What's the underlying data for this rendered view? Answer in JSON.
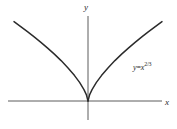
{
  "figure": {
    "background_color": "#ffffff",
    "ink_color": "#2b2b2b",
    "axis_color": "#4a4a4a",
    "width": 177,
    "height": 129
  },
  "axes": {
    "x_label": "x",
    "y_label": "y",
    "origin": {
      "x": 88,
      "y": 101
    },
    "x_axis_start_px": 8,
    "x_axis_end_px": 162,
    "y_axis_top_px": 16,
    "y_axis_bottom_px": 120
  },
  "annotation": {
    "equation_y": "y",
    "equation_equals": "=",
    "equation_base": "x",
    "equation_exponent": "2/3",
    "equation_full": "y=x^(2/3)"
  },
  "chart_data": {
    "type": "line",
    "title": "",
    "xlabel": "x",
    "ylabel": "y",
    "grid": false,
    "legend": "none",
    "annotations": [
      {
        "text": "y=x^(2/3)",
        "x_px": 133,
        "y_px": 61
      }
    ],
    "xlim": [
      -2.2,
      2.2
    ],
    "ylim": [
      0,
      1.75
    ],
    "series": [
      {
        "name": "y=x^(2/3)",
        "color": "#2b2b2b",
        "x": [
          -2.2,
          -2.0,
          -1.8,
          -1.6,
          -1.4,
          -1.2,
          -1.0,
          -0.8,
          -0.6,
          -0.4,
          -0.25,
          -0.12,
          -0.05,
          0,
          0.05,
          0.12,
          0.25,
          0.4,
          0.6,
          0.8,
          1.0,
          1.2,
          1.4,
          1.6,
          1.8,
          2.0,
          2.2
        ],
        "y": [
          1.695,
          1.587,
          1.48,
          1.368,
          1.251,
          1.129,
          1.0,
          0.862,
          0.711,
          0.543,
          0.397,
          0.243,
          0.136,
          0,
          0.136,
          0.243,
          0.397,
          0.543,
          0.711,
          0.862,
          1.0,
          1.129,
          1.251,
          1.368,
          1.48,
          1.587,
          1.695
        ]
      }
    ]
  }
}
